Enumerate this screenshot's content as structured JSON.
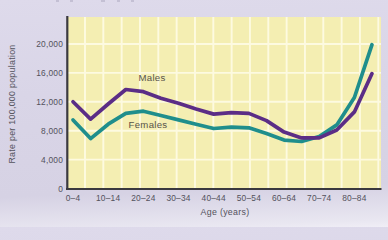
{
  "chart_data": {
    "type": "line",
    "title": "",
    "xlabel": "Age (years)",
    "ylabel": "Rate per 100,000 population",
    "categories": [
      "0–4",
      "5–9",
      "10–14",
      "15–19",
      "20–24",
      "25–29",
      "30–34",
      "35–39",
      "40–44",
      "45–49",
      "50–54",
      "55–59",
      "60–64",
      "65–69",
      "70–74",
      "75–79",
      "80–84",
      "85+"
    ],
    "x_tick_labels": [
      "0–4",
      "10–14",
      "20–24",
      "30–34",
      "40–44",
      "50–54",
      "60–64",
      "70–74",
      "80–84"
    ],
    "y_ticks": [
      0,
      4000,
      8000,
      12000,
      16000,
      20000
    ],
    "y_tick_labels": [
      "0",
      "4,000",
      "8,000",
      "12,000",
      "16,000",
      "20,000"
    ],
    "ylim": [
      0,
      23700
    ],
    "grid": true,
    "legend_position": "inline-labels",
    "series": [
      {
        "name": "Males",
        "color": "#5b2d86",
        "values": [
          12000,
          9600,
          11700,
          13700,
          13400,
          12500,
          11800,
          11000,
          10300,
          10500,
          10400,
          9400,
          7800,
          7000,
          7000,
          8100,
          10600,
          15900
        ]
      },
      {
        "name": "Females",
        "color": "#1f8e8c",
        "values": [
          9500,
          6900,
          8900,
          10400,
          10700,
          10100,
          9500,
          8900,
          8300,
          8500,
          8400,
          7600,
          6700,
          6500,
          7200,
          8800,
          12600,
          19900
        ]
      }
    ],
    "colors": {
      "page_bg": "#d8d4e6",
      "plot_bg": "#f4eeb2",
      "gridline": "#fdfae0",
      "axis_line": "#3a393f",
      "tick_text": "#53525c",
      "series_label_text": "#57544a"
    }
  }
}
